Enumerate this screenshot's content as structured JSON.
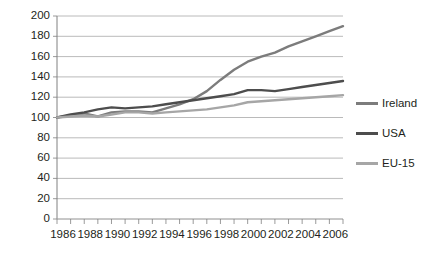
{
  "chart_data": {
    "type": "line",
    "title": "",
    "xlabel": "",
    "ylabel": "",
    "ylim": [
      0,
      200
    ],
    "xlim": [
      1986,
      2007
    ],
    "ytick_step": 20,
    "grid": "horizontal",
    "legend_position": "right",
    "yticks": [
      "0",
      "20",
      "40",
      "60",
      "80",
      "100",
      "120",
      "140",
      "160",
      "180",
      "200"
    ],
    "x": [
      1986,
      1987,
      1988,
      1989,
      1990,
      1991,
      1992,
      1993,
      1994,
      1995,
      1996,
      1997,
      1998,
      1999,
      2000,
      2001,
      2002,
      2003,
      2004,
      2005,
      2006,
      2007
    ],
    "xtick_labels": [
      "1986",
      "1988",
      "1990",
      "1992",
      "1994",
      "1996",
      "1998",
      "2000",
      "2002",
      "2004",
      "2006"
    ],
    "xtick_values": [
      1986,
      1988,
      1990,
      1992,
      1994,
      1996,
      1998,
      2000,
      2002,
      2004,
      2006
    ],
    "series": [
      {
        "name": "Ireland",
        "color": "#7c7c7c",
        "values": [
          100,
          102,
          104,
          101,
          105,
          106,
          106,
          105,
          109,
          113,
          118,
          126,
          137,
          147,
          155,
          160,
          164,
          170,
          175,
          180,
          185,
          190
        ]
      },
      {
        "name": "USA",
        "color": "#4d4d4d",
        "values": [
          100,
          103,
          105,
          108,
          110,
          109,
          110,
          111,
          113,
          115,
          117,
          119,
          121,
          123,
          127,
          127,
          126,
          128,
          130,
          132,
          134,
          136
        ]
      },
      {
        "name": "EU-15",
        "color": "#a6a6a6",
        "values": [
          100,
          101,
          102,
          101,
          103,
          105,
          105,
          104,
          105,
          106,
          107,
          108,
          110,
          112,
          115,
          116,
          117,
          118,
          119,
          120,
          121,
          122
        ]
      }
    ]
  },
  "legend": {
    "items": [
      {
        "label": "Ireland"
      },
      {
        "label": "USA"
      },
      {
        "label": "EU-15"
      }
    ]
  },
  "axes": {
    "gridline_color": "#a8a8a8",
    "axis_color": "#808080"
  }
}
